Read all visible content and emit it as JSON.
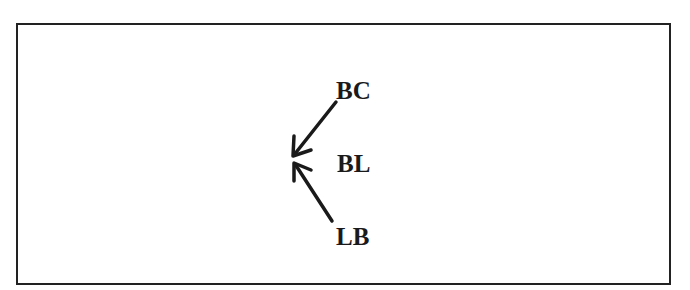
{
  "diagram": {
    "nodes": [
      {
        "id": "bc",
        "label": "BC"
      },
      {
        "id": "bl",
        "label": "BL"
      },
      {
        "id": "lb",
        "label": "LB"
      }
    ],
    "arrows": [
      {
        "from": "BC",
        "to": "convergence-point"
      },
      {
        "from": "LB",
        "to": "convergence-point"
      }
    ],
    "colors": {
      "stroke": "#1a1a1a",
      "border": "#222222",
      "background": "#ffffff"
    }
  }
}
